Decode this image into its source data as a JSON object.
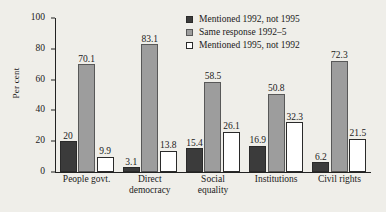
{
  "chart_data": {
    "type": "bar",
    "title": "",
    "xlabel": "",
    "ylabel": "Per cent",
    "ylim": [
      0,
      100
    ],
    "yticks": [
      "0",
      "20",
      "40",
      "60",
      "80",
      "100"
    ],
    "grid": false,
    "legend_position": "top-right",
    "categories": [
      "People govt.",
      "Direct\ndemocracy",
      "Social\nequality",
      "Institutions",
      "Civil rights"
    ],
    "series": [
      {
        "name": "Mentioned 1992, not 1995",
        "color": "#3b3b3b",
        "values": [
          20,
          3.1,
          15.4,
          16.9,
          6.2
        ],
        "labels": [
          "20",
          "3.1",
          "15.4",
          "16.9",
          "6.2"
        ]
      },
      {
        "name": "Same response 1992–5",
        "color": "#9d9d9d",
        "values": [
          70.1,
          83.1,
          58.5,
          50.8,
          72.3
        ],
        "labels": [
          "70.1",
          "83.1",
          "58.5",
          "50.8",
          "72.3"
        ]
      },
      {
        "name": "Mentioned 1995, not 1992",
        "color": "#ffffff",
        "values": [
          9.9,
          13.8,
          26.1,
          32.3,
          21.5
        ],
        "labels": [
          "9.9",
          "13.8",
          "26.1",
          "32.3",
          "21.5"
        ]
      }
    ]
  }
}
